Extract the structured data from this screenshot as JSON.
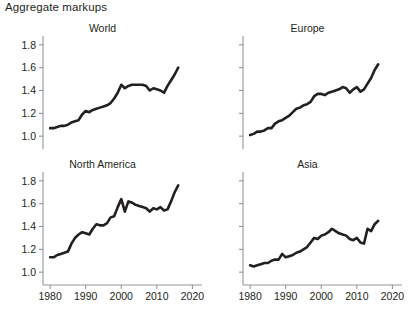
{
  "figure": {
    "title": "Aggregate markups",
    "background_color": "#ffffff",
    "line_color": "#231f20",
    "axis_color": "#939598"
  },
  "chart_data": [
    {
      "type": "line",
      "title": "World",
      "panel": "top-left",
      "xlabel": "",
      "ylabel": "",
      "xlim": [
        1978,
        2021
      ],
      "ylim": [
        0.94,
        1.86
      ],
      "grid": false,
      "legend": "none",
      "xticks": [
        1980,
        1990,
        2000,
        2010,
        2020
      ],
      "xtick_labels": [
        "",
        "",
        "",
        "",
        ""
      ],
      "yticks": [
        1.0,
        1.2,
        1.4,
        1.6,
        1.8
      ],
      "ytick_labels": [
        "1.0",
        "1.2",
        "1.4",
        "1.6",
        "1.8"
      ],
      "x": [
        1980,
        1981,
        1982,
        1983,
        1984,
        1985,
        1986,
        1987,
        1988,
        1989,
        1990,
        1991,
        1992,
        1993,
        1994,
        1995,
        1996,
        1997,
        1998,
        1999,
        2000,
        2001,
        2002,
        2003,
        2004,
        2005,
        2006,
        2007,
        2008,
        2009,
        2010,
        2011,
        2012,
        2013,
        2014,
        2015,
        2016
      ],
      "values": [
        1.07,
        1.07,
        1.08,
        1.09,
        1.09,
        1.1,
        1.12,
        1.13,
        1.14,
        1.19,
        1.22,
        1.21,
        1.23,
        1.24,
        1.25,
        1.26,
        1.27,
        1.29,
        1.33,
        1.38,
        1.45,
        1.42,
        1.44,
        1.45,
        1.45,
        1.45,
        1.45,
        1.44,
        1.4,
        1.42,
        1.41,
        1.4,
        1.38,
        1.44,
        1.49,
        1.54,
        1.6
      ]
    },
    {
      "type": "line",
      "title": "Europe",
      "panel": "top-right",
      "xlabel": "",
      "ylabel": "",
      "xlim": [
        1978,
        2021
      ],
      "ylim": [
        0.94,
        1.86
      ],
      "grid": false,
      "legend": "none",
      "xticks": [
        1980,
        1990,
        2000,
        2010,
        2020
      ],
      "xtick_labels": [
        "",
        "",
        "",
        "",
        ""
      ],
      "yticks": [
        1.0,
        1.2,
        1.4,
        1.6,
        1.8
      ],
      "ytick_labels": [
        "",
        "",
        "",
        "",
        ""
      ],
      "x": [
        1980,
        1981,
        1982,
        1983,
        1984,
        1985,
        1986,
        1987,
        1988,
        1989,
        1990,
        1991,
        1992,
        1993,
        1994,
        1995,
        1996,
        1997,
        1998,
        1999,
        2000,
        2001,
        2002,
        2003,
        2004,
        2005,
        2006,
        2007,
        2008,
        2009,
        2010,
        2011,
        2012,
        2013,
        2014,
        2015,
        2016
      ],
      "values": [
        1.01,
        1.02,
        1.04,
        1.04,
        1.05,
        1.07,
        1.07,
        1.11,
        1.13,
        1.14,
        1.16,
        1.18,
        1.21,
        1.24,
        1.25,
        1.27,
        1.28,
        1.3,
        1.35,
        1.37,
        1.37,
        1.36,
        1.38,
        1.39,
        1.4,
        1.41,
        1.43,
        1.42,
        1.38,
        1.41,
        1.43,
        1.39,
        1.41,
        1.46,
        1.51,
        1.58,
        1.63
      ]
    },
    {
      "type": "line",
      "title": "North America",
      "panel": "bottom-left",
      "xlabel": "",
      "ylabel": "",
      "xlim": [
        1978,
        2021
      ],
      "ylim": [
        0.94,
        1.86
      ],
      "grid": false,
      "legend": "none",
      "xticks": [
        1980,
        1990,
        2000,
        2010,
        2020
      ],
      "xtick_labels": [
        "1980",
        "1990",
        "2000",
        "2010",
        "2020"
      ],
      "yticks": [
        1.0,
        1.2,
        1.4,
        1.6,
        1.8
      ],
      "ytick_labels": [
        "1.0",
        "1.2",
        "1.4",
        "1.6",
        "1.8"
      ],
      "x": [
        1980,
        1981,
        1982,
        1983,
        1984,
        1985,
        1986,
        1987,
        1988,
        1989,
        1990,
        1991,
        1992,
        1993,
        1994,
        1995,
        1996,
        1997,
        1998,
        1999,
        2000,
        2001,
        2002,
        2003,
        2004,
        2005,
        2006,
        2007,
        2008,
        2009,
        2010,
        2011,
        2012,
        2013,
        2014,
        2015,
        2016
      ],
      "values": [
        1.13,
        1.13,
        1.15,
        1.16,
        1.17,
        1.18,
        1.25,
        1.3,
        1.33,
        1.35,
        1.34,
        1.33,
        1.38,
        1.42,
        1.41,
        1.41,
        1.43,
        1.48,
        1.49,
        1.57,
        1.64,
        1.53,
        1.62,
        1.61,
        1.59,
        1.58,
        1.57,
        1.56,
        1.53,
        1.56,
        1.55,
        1.57,
        1.54,
        1.55,
        1.62,
        1.7,
        1.76
      ]
    },
    {
      "type": "line",
      "title": "Asia",
      "panel": "bottom-right",
      "xlabel": "",
      "ylabel": "",
      "xlim": [
        1978,
        2021
      ],
      "ylim": [
        0.94,
        1.86
      ],
      "grid": false,
      "legend": "none",
      "xticks": [
        1980,
        1990,
        2000,
        2010,
        2020
      ],
      "xtick_labels": [
        "1980",
        "1990",
        "2000",
        "2010",
        "2020"
      ],
      "yticks": [
        1.0,
        1.2,
        1.4,
        1.6,
        1.8
      ],
      "ytick_labels": [
        "",
        "",
        "",
        "",
        ""
      ],
      "x": [
        1980,
        1981,
        1982,
        1983,
        1984,
        1985,
        1986,
        1987,
        1988,
        1989,
        1990,
        1991,
        1992,
        1993,
        1994,
        1995,
        1996,
        1997,
        1998,
        1999,
        2000,
        2001,
        2002,
        2003,
        2004,
        2005,
        2006,
        2007,
        2008,
        2009,
        2010,
        2011,
        2012,
        2013,
        2014,
        2015,
        2016
      ],
      "values": [
        1.06,
        1.05,
        1.06,
        1.07,
        1.08,
        1.08,
        1.1,
        1.11,
        1.11,
        1.16,
        1.13,
        1.14,
        1.15,
        1.17,
        1.18,
        1.2,
        1.22,
        1.26,
        1.3,
        1.29,
        1.32,
        1.33,
        1.35,
        1.38,
        1.36,
        1.34,
        1.33,
        1.32,
        1.29,
        1.28,
        1.3,
        1.26,
        1.25,
        1.38,
        1.36,
        1.42,
        1.45
      ]
    }
  ]
}
